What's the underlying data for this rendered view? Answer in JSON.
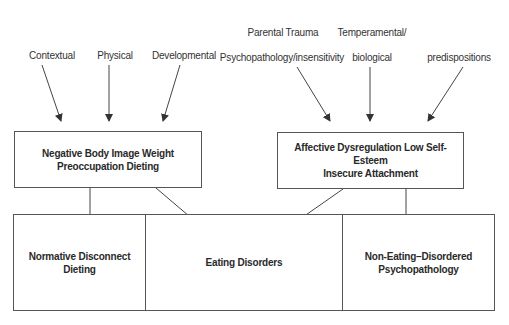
{
  "diagram": {
    "risk_factors_left": {
      "contextual": "Contextual",
      "physical": "Physical",
      "developmental": "Developmental"
    },
    "risk_factors_right": {
      "parental_line1": "Parental Trauma",
      "parental_line2": "Psychopathology/insensitivity",
      "temperamental_line1": "Temperamental/",
      "temperamental_line2": "biological",
      "predispositions": "predispositions"
    },
    "mediators": {
      "left": "Negative Body Image Weight\nPreoccupation Dieting",
      "right": "Affective Dysregulation Low Self-Esteem\nInsecure Attachment"
    },
    "outcomes": {
      "normative": "Normative Disconnect\nDieting",
      "eating_disorders": "Eating Disorders",
      "non_eating": "Non-Eating–Disordered\nPsychopathology"
    },
    "colors": {
      "line": "#444444",
      "border": "#555555",
      "text": "#2a2a2a"
    }
  }
}
